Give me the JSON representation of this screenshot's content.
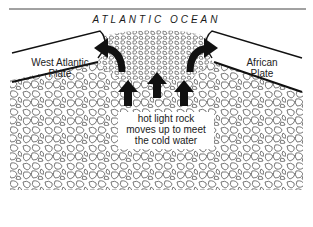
{
  "diagram": {
    "title": "ATLANTIC OCEAN",
    "plates": {
      "left": {
        "line1": "West Atlantic",
        "line2": "Plate"
      },
      "right": {
        "line1": "African",
        "line2": "Plate"
      }
    },
    "caption": {
      "line1": "hot light rock",
      "line2": "moves up to meet",
      "line3": "the cold water"
    },
    "arrows": {
      "up_count": 3,
      "curved": [
        "left-outward",
        "right-outward"
      ]
    },
    "colors": {
      "ink": "#111111",
      "rock_outline": "#555555",
      "background": "#ffffff"
    }
  }
}
